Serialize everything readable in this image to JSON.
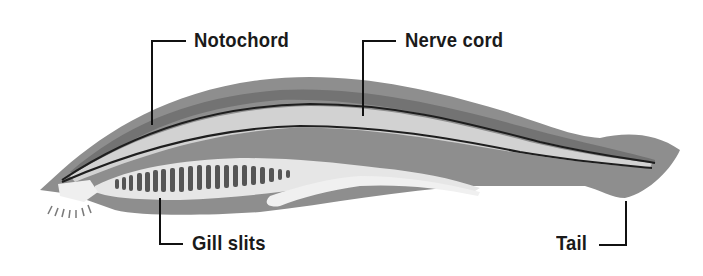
{
  "diagram": {
    "labels": {
      "notochord": "Notochord",
      "nerve_cord": "Nerve cord",
      "gill_slits": "Gill slits",
      "tail": "Tail"
    },
    "colors": {
      "body_outer": "#8e8e8e",
      "body_dorsal_band": "#6f6f6f",
      "body_light": "#d6d6d6",
      "pharynx": "#e8e8e8",
      "gill_bar": "#555555",
      "outline_line": "#1e1e1e",
      "leader_line": "#111111"
    },
    "gill_slit_count": 21
  }
}
